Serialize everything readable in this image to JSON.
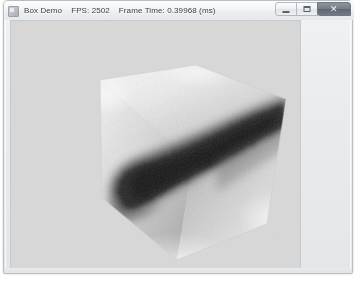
{
  "window": {
    "app_icon": "app-window-icon",
    "title": "Box Demo",
    "fps_label": "FPS: 2502",
    "frame_time_label": "Frame Time: 0.39968 (ms)",
    "controls": {
      "minimize": "minimize-button",
      "maximize": "maximize-button",
      "close": "close-button"
    },
    "colors": {
      "frame": "#e6e9eb",
      "titlebar_text": "#3b4148",
      "client_background": "#d8d8d8",
      "close_button": "#6e767f"
    }
  },
  "render": {
    "scene_name": "Box Demo",
    "object": "textured-cube",
    "description": "Volume-rendered cube with noise texture, three visible faces",
    "viewport": {
      "width": 291,
      "height": 249
    },
    "cube": {
      "vertices": {
        "top": [
          185,
          44
        ],
        "top_left": [
          89,
          59
        ],
        "left": [
          91,
          177
        ],
        "bottom": [
          166,
          239
        ],
        "bottom_right": [
          256,
          203
        ],
        "right": [
          275,
          78
        ],
        "center": [
          182,
          140
        ]
      },
      "faces": [
        {
          "name": "top-face",
          "shade_from": "#f6f6f6",
          "shade_to": "#cfcfcf"
        },
        {
          "name": "left-face",
          "shade_from": "#efefef",
          "shade_to": "#b4b4b4"
        },
        {
          "name": "right-face",
          "shade_from": "#d4d4d4",
          "shade_to": "#8e8e8e"
        }
      ],
      "blob": {
        "name": "dark-volumetric-blob",
        "color": "#2a2a2a",
        "path": "M 112,182 C 104,168 110,152 128,146 C 150,138 176,126 198,116 C 224,104 250,92 268,86 L 272,102 C 252,114 228,128 206,140 C 184,152 160,166 142,176 C 128,184 118,190 112,182 Z"
      }
    }
  }
}
